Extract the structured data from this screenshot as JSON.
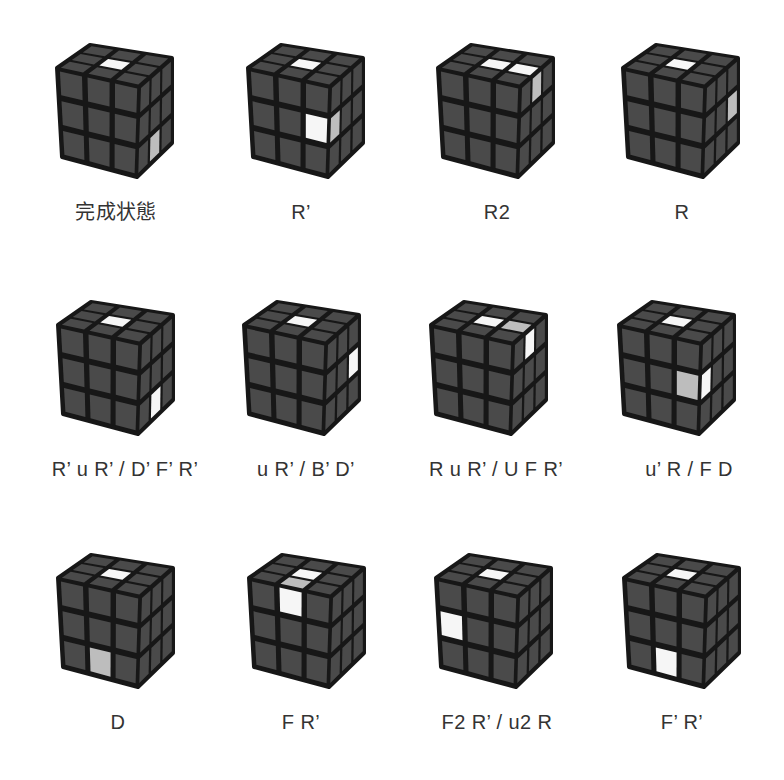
{
  "colors": {
    "sticker": "#4a4a4a",
    "gap": "#171717",
    "white": "#f6f6f6",
    "gray": "#bdbdbd",
    "label": "#333333"
  },
  "cases": [
    {
      "label": "完成状態",
      "highlights": [
        {
          "face": "top",
          "row": 1,
          "col": 1,
          "color": "white"
        },
        {
          "face": "right",
          "row": 2,
          "col": 1,
          "color": "gray"
        }
      ]
    },
    {
      "label": "R’",
      "highlights": [
        {
          "face": "top",
          "row": 1,
          "col": 1,
          "color": "white"
        },
        {
          "face": "front",
          "row": 1,
          "col": 2,
          "color": "white"
        },
        {
          "face": "right",
          "row": 1,
          "col": 0,
          "color": "gray"
        }
      ]
    },
    {
      "label": "R2",
      "highlights": [
        {
          "face": "top",
          "row": 1,
          "col": 1,
          "color": "white"
        },
        {
          "face": "top",
          "row": 1,
          "col": 2,
          "color": "white"
        },
        {
          "face": "right",
          "row": 0,
          "col": 1,
          "color": "gray"
        }
      ]
    },
    {
      "label": "R",
      "highlights": [
        {
          "face": "top",
          "row": 1,
          "col": 1,
          "color": "white"
        },
        {
          "face": "right",
          "row": 1,
          "col": 2,
          "color": "gray"
        }
      ]
    },
    {
      "label": "R’ u R’ / D’ F’ R’",
      "highlights": [
        {
          "face": "top",
          "row": 1,
          "col": 1,
          "color": "white"
        },
        {
          "face": "right",
          "row": 2,
          "col": 1,
          "color": "white"
        }
      ]
    },
    {
      "label": "u R’ / B’ D’",
      "highlights": [
        {
          "face": "top",
          "row": 1,
          "col": 1,
          "color": "white"
        },
        {
          "face": "right",
          "row": 1,
          "col": 2,
          "color": "white"
        }
      ]
    },
    {
      "label": "R u R’ / U F R’",
      "highlights": [
        {
          "face": "top",
          "row": 1,
          "col": 1,
          "color": "white"
        },
        {
          "face": "top",
          "row": 1,
          "col": 2,
          "color": "gray"
        },
        {
          "face": "right",
          "row": 0,
          "col": 1,
          "color": "white"
        }
      ]
    },
    {
      "label": "u’ R / F D",
      "highlights": [
        {
          "face": "top",
          "row": 1,
          "col": 1,
          "color": "white"
        },
        {
          "face": "front",
          "row": 1,
          "col": 2,
          "color": "gray"
        },
        {
          "face": "right",
          "row": 1,
          "col": 0,
          "color": "white"
        }
      ]
    },
    {
      "label": "D",
      "highlights": [
        {
          "face": "top",
          "row": 1,
          "col": 1,
          "color": "white"
        },
        {
          "face": "front",
          "row": 2,
          "col": 1,
          "color": "gray"
        }
      ]
    },
    {
      "label": "F R’",
      "highlights": [
        {
          "face": "top",
          "row": 1,
          "col": 1,
          "color": "white"
        },
        {
          "face": "top",
          "row": 2,
          "col": 1,
          "color": "gray"
        },
        {
          "face": "front",
          "row": 0,
          "col": 1,
          "color": "white"
        }
      ]
    },
    {
      "label": "F2 R’ / u2 R",
      "highlights": [
        {
          "face": "top",
          "row": 1,
          "col": 1,
          "color": "white"
        },
        {
          "face": "front",
          "row": 1,
          "col": 0,
          "color": "white"
        }
      ]
    },
    {
      "label": "F’ R’",
      "highlights": [
        {
          "face": "top",
          "row": 1,
          "col": 1,
          "color": "white"
        },
        {
          "face": "front",
          "row": 2,
          "col": 1,
          "color": "white"
        }
      ]
    }
  ]
}
